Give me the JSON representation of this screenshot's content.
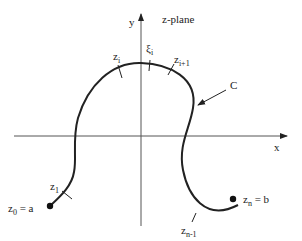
{
  "diagram": {
    "title": "z-plane",
    "axes": {
      "x_label": "x",
      "y_label": "y"
    },
    "curve_label": "C",
    "points": {
      "start": {
        "label": "z",
        "sub": "0",
        "suffix": " = a"
      },
      "end": {
        "label": "z",
        "sub": "n",
        "suffix": " = b"
      },
      "z1": {
        "label": "z",
        "sub": "1"
      },
      "zi": {
        "label": "z",
        "sub": "i"
      },
      "xi": {
        "label": "ξ",
        "sub": "i"
      },
      "zi1": {
        "label": "z",
        "sub": "i+1"
      },
      "zn1": {
        "label": "z",
        "sub": "n-1"
      }
    },
    "colors": {
      "line": "#222222",
      "background": "#ffffff"
    }
  }
}
